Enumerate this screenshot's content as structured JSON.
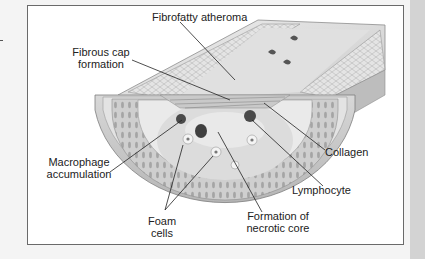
{
  "figure": {
    "labels": {
      "fibrofatty_atheroma": "Fibrofatty atheroma",
      "fibrous_cap_1": "Fibrous cap",
      "fibrous_cap_2": "formation",
      "macrophage_1": "Macrophage",
      "macrophage_2": "accumulation",
      "foam_1": "Foam",
      "foam_2": "cells",
      "necrotic_1": "Formation of",
      "necrotic_2": "necrotic core",
      "collagen": "Collagen",
      "lymphocyte": "Lymphocyte"
    },
    "colors": {
      "background": "#f4f4f4",
      "frame": "#ffffff",
      "frame_border": "#6a6a6a",
      "side_strip": "#d3d3d3",
      "tissue_light": "#e6e6e6",
      "tissue_mid": "#c4c4c4",
      "tissue_dark": "#8d8d8d",
      "cell_nucleus": "#4a4a4a"
    }
  }
}
